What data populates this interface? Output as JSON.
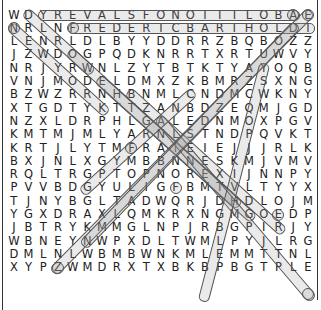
{
  "puzzle": {
    "type": "word-search",
    "rows": [
      "WDYREVALSFONOITILOBAE",
      "NRLNFREDERICBARTHOLDI",
      "LENRLDLBYYDDRRZBQBOZZ",
      "JZWDOGPQDKNRRTXRTUWVY",
      "NRJYRWNLZYTBTKTYAYOQB",
      "VNJMODELDMXZKBMRZSXNG",
      "BZWZRRNHBNMLCNDMCWKNY",
      "XTGDTYKTTZANBDZEQMJGD",
      "NZXLDRPHLGALEDNMOXPGV",
      "KMTMJMLYARNLSTNDPQVKT",
      "KRTJLYTMFRAIEIEJJJRLK",
      "BXJNLXGYMBBNNESKMJVMV",
      "RQLTRGPTOPNOREXIJNNPY",
      "PVVBDGYULIGFBMTVLTYYX",
      "TJNYBGLTADWQRJDHDLOJM",
      "YGXDRAXLQMKRXNGMGOEDP",
      "JBTRYKMMGLNPJRBGPIRJY",
      "WBNEYNWPXDLTWMLPYJLRG",
      "DMLNLWBMBWNKMLEMMTTNL",
      "XYPZWMDRXTXBKBPBGTPLE"
    ],
    "highlights": [
      {
        "r1": 1,
        "c1": 3,
        "r2": 1,
        "c2": 20
      },
      {
        "r1": 2,
        "c1": 5,
        "r2": 2,
        "c2": 21
      },
      {
        "r1": 1,
        "c1": 2,
        "r2": 5,
        "c2": 6
      },
      {
        "r1": 2,
        "c1": 1,
        "r2": 8,
        "c2": 7
      },
      {
        "r1": 4,
        "c1": 5,
        "r2": 15,
        "c2": 16
      },
      {
        "r1": 6,
        "c1": 7,
        "r2": 16,
        "c2": 17
      },
      {
        "r1": 7,
        "c1": 9,
        "r2": 17,
        "c2": 19
      },
      {
        "r1": 9,
        "c1": 11,
        "r2": 22,
        "c2": 21
      },
      {
        "r1": 1,
        "c1": 21,
        "r2": 20,
        "c2": 4
      },
      {
        "r1": 2,
        "c1": 20,
        "r2": 18,
        "c2": 6
      },
      {
        "r1": 5,
        "c1": 18,
        "r2": 22,
        "c2": 14
      },
      {
        "r1": 7,
        "c1": 13,
        "r2": 14,
        "c2": 6
      }
    ],
    "circled": [
      {
        "r": 1,
        "c": 20
      },
      {
        "r": 1,
        "c": 21
      },
      {
        "r": 2,
        "c": 1
      },
      {
        "r": 2,
        "c": 5
      },
      {
        "r": 11,
        "c": 9
      },
      {
        "r": 14,
        "c": 12
      },
      {
        "r": 16,
        "c": 19
      },
      {
        "r": 20,
        "c": 4
      },
      {
        "r": 22,
        "c": 21
      }
    ]
  }
}
